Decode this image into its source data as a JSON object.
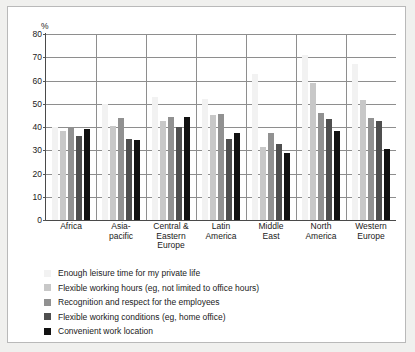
{
  "chart_data": {
    "type": "bar",
    "title": "",
    "xlabel": "",
    "ylabel": "%",
    "ylim": [
      0,
      80
    ],
    "yticks": [
      80,
      70,
      60,
      50,
      40,
      30,
      20,
      10,
      0
    ],
    "grid": true,
    "legend_position": "below",
    "categories": [
      "Africa",
      "Asia-\npacific",
      "Central &\nEastern\nEurope",
      "Latin\nAmerica",
      "Middle\nEast",
      "North\nAmerica",
      "Western\nEurope"
    ],
    "series": [
      {
        "name": "Enough leisure time for my private life",
        "color": "#f2f2f2",
        "values": [
          40,
          50,
          53,
          52,
          63,
          71,
          67
        ]
      },
      {
        "name": "Flexible working hours (eg, not limited to office hours)",
        "color": "#c8c8c8",
        "values": [
          38.5,
          40.5,
          42.5,
          45,
          31.5,
          59,
          51.5
        ]
      },
      {
        "name": "Recognition and respect for the employees",
        "color": "#919191",
        "values": [
          39.5,
          44,
          44.5,
          45.5,
          37.5,
          46,
          44
        ]
      },
      {
        "name": "Flexible working conditions (eg, home office)",
        "color": "#4f4f4f",
        "values": [
          36,
          35,
          40,
          35,
          32.5,
          43.5,
          42.5
        ]
      },
      {
        "name": "Convenient work location",
        "color": "#111111",
        "values": [
          39,
          34.5,
          44.5,
          37.5,
          29,
          38.5,
          30.5
        ]
      }
    ]
  },
  "legend": {
    "items": [
      "Enough leisure time for my private life",
      "Flexible working hours (eg, not limited to office hours)",
      "Recognition and respect for the employees",
      "Flexible working conditions (eg, home office)",
      "Convenient work location"
    ]
  }
}
